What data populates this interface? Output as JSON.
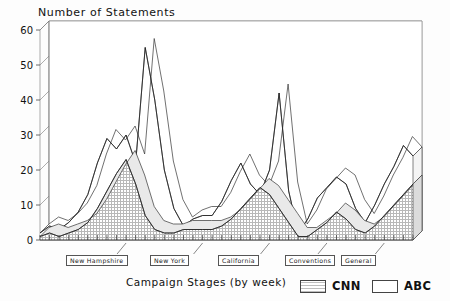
{
  "chart_data": {
    "type": "area",
    "title": "Number of Statements",
    "xlabel": "Campaign Stages (by week)",
    "ylabel": "Number of Statements",
    "ylim": [
      0,
      60
    ],
    "yticks": [
      0,
      10,
      20,
      30,
      40,
      50,
      60
    ],
    "grid": true,
    "legend_position": "bottom-right",
    "x": [
      1,
      2,
      3,
      4,
      5,
      6,
      7,
      8,
      9,
      10,
      11,
      12,
      13,
      14,
      15,
      16,
      17,
      18,
      19,
      20,
      21,
      22,
      23,
      24,
      25,
      26,
      27,
      28,
      29,
      30,
      31,
      32,
      33,
      34,
      35,
      36,
      37,
      38,
      39,
      40
    ],
    "series": [
      {
        "name": "CNN",
        "fill": "hatched-gray",
        "values": [
          1,
          2,
          1,
          2,
          3,
          5,
          9,
          14,
          19,
          23,
          16,
          7,
          3,
          2,
          2,
          3,
          3,
          3,
          3,
          4,
          6,
          9,
          12,
          15,
          13,
          9,
          5,
          1,
          1,
          3,
          5,
          8,
          6,
          3,
          2,
          4,
          7,
          10,
          13,
          16
        ]
      },
      {
        "name": "ABC",
        "fill": "white",
        "values": [
          2,
          4,
          3,
          5,
          8,
          13,
          22,
          29,
          26,
          30,
          22,
          55,
          40,
          20,
          9,
          4,
          6,
          7,
          7,
          11,
          17,
          22,
          16,
          13,
          20,
          42,
          14,
          2,
          6,
          12,
          15,
          18,
          16,
          9,
          5,
          10,
          16,
          21,
          27,
          24
        ]
      }
    ],
    "annotations": [
      {
        "label": "New Hampshire"
      },
      {
        "label": "New York"
      },
      {
        "label": "California"
      },
      {
        "label": "Conventions"
      },
      {
        "label": "General"
      }
    ]
  },
  "legend": {
    "items": [
      {
        "label": "CNN",
        "swatch": "hatched-gray"
      },
      {
        "label": "ABC",
        "swatch": "white"
      }
    ]
  },
  "axis": {
    "yticks": [
      "60",
      "50",
      "40",
      "30",
      "20",
      "10",
      "0"
    ]
  }
}
